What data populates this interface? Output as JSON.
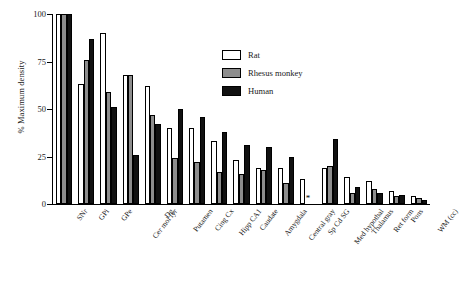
{
  "chart_data": {
    "type": "bar",
    "title": "",
    "xlabel": "",
    "ylabel": "% Maximum density",
    "ylim": [
      0,
      100
    ],
    "yticks": [
      0,
      25,
      50,
      75,
      100
    ],
    "ytick_labels": [
      "0",
      "25",
      "50",
      "75",
      "100"
    ],
    "grid": false,
    "legend_position": "upper right",
    "categories": [
      "SNr",
      "GPi",
      "GPe",
      "Cer mol lyr",
      "Dg",
      "Putamen",
      "Cing Cx",
      "Hipp CA1",
      "Caudate",
      "Amygdala",
      "Central gray",
      "Sp Cd SG",
      "Med hypothal",
      "Thalamus",
      "Ret form",
      "Pons",
      "WM (cc)"
    ],
    "series": [
      {
        "name": "Rat",
        "color": "#ffffff",
        "values": [
          100,
          63,
          90,
          68,
          62,
          40,
          40,
          33,
          23,
          19,
          19,
          13,
          19,
          14,
          12,
          7,
          4
        ]
      },
      {
        "name": "Rhesus monkey",
        "color": "#8d8d8d",
        "values": [
          100,
          76,
          59,
          68,
          47,
          24,
          22,
          17,
          16,
          18,
          11,
          0,
          20,
          6,
          8,
          4,
          3
        ]
      },
      {
        "name": "Human",
        "color": "#111111",
        "values": [
          100,
          87,
          51,
          26,
          42,
          50,
          46,
          38,
          31,
          30,
          25,
          0,
          34,
          9,
          6,
          5,
          2
        ]
      }
    ],
    "annotations": [
      {
        "text": "*",
        "category": "Sp Cd SG",
        "note": "no data bar"
      }
    ]
  },
  "legend": {
    "items": [
      {
        "label": "Rat",
        "swatch": "rat"
      },
      {
        "label": "Rhesus monkey",
        "swatch": "rhesus"
      },
      {
        "label": "Human",
        "swatch": "human"
      }
    ]
  }
}
